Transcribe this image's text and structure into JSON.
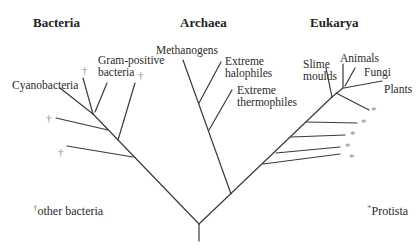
{
  "headings": {
    "bacteria": "Bacteria",
    "archaea": "Archaea",
    "eukarya": "Eukarya"
  },
  "bacteria": {
    "cyanobacteria": "Cyanobacteria",
    "gram_positive_line1": "Gram-positive",
    "gram_positive_line2": "bacteria",
    "other_marker": "†"
  },
  "archaea": {
    "methanogens": "Methanogens",
    "halophiles_line1": "Extreme",
    "halophiles_line2": "halophiles",
    "thermophiles_line1": "Extreme",
    "thermophiles_line2": "thermophiles"
  },
  "eukarya": {
    "slime_line1": "Slime",
    "slime_line2": "moulds",
    "animals": "Animals",
    "fungi": "Fungi",
    "plants": "Plants",
    "protist_marker": "*"
  },
  "legend": {
    "bacteria_marker": "†",
    "bacteria_text": "other bacteria",
    "protista_marker": "*",
    "protista_text": "Protista"
  },
  "colors": {
    "line": "#3a3a3a",
    "marker": "#8a8a8a",
    "text": "#2a2a2a"
  }
}
